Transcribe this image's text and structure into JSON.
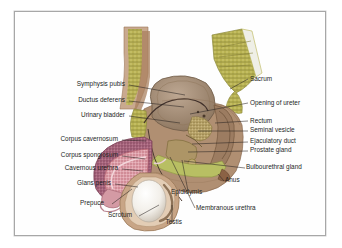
{
  "figure": {
    "frame_border_color": "#a7a7a7",
    "background_color": "#ffffff",
    "label_text_color": "#231f1d",
    "leader_line_color": "#2b2523"
  },
  "labels_left": [
    {
      "name": "symphysis-pubis",
      "text": "Symphysis pubis",
      "x": 126,
      "y": 74,
      "tx": 183,
      "ty": 84
    },
    {
      "name": "ductus-deferens",
      "text": "Ductus deferens",
      "x": 126,
      "y": 90,
      "tx": 182,
      "ty": 96
    },
    {
      "name": "urinary-bladder",
      "text": "Urinary bladder",
      "x": 126,
      "y": 105,
      "tx": 178,
      "ty": 112
    },
    {
      "name": "corpus-cavernosum",
      "text": "Corpus cavernosum",
      "x": 119,
      "y": 129,
      "tx": 144,
      "ty": 130
    },
    {
      "name": "corpus-spongiosum",
      "text": "Corpus spongiosum",
      "x": 119,
      "y": 145,
      "tx": 143,
      "ty": 148
    },
    {
      "name": "cavernous-urethra",
      "text": "Cavernous urethra",
      "x": 119,
      "y": 158,
      "tx": 141,
      "ty": 160
    },
    {
      "name": "glans-penis",
      "text": "Glans penis",
      "x": 112,
      "y": 173,
      "tx": 136,
      "ty": 176
    },
    {
      "name": "prepuce",
      "text": "Prepuce",
      "x": 104,
      "y": 195,
      "tx": 130,
      "ty": 178
    },
    {
      "name": "scrotum",
      "text": "Scrotum",
      "x": 134,
      "y": 207,
      "tx": 157,
      "ty": 196
    },
    {
      "name": "testis",
      "text": "Testis",
      "x": 168,
      "y": 215,
      "tx": 170,
      "ty": 196
    }
  ],
  "labels_right": [
    {
      "name": "sacrum",
      "text": "Sacrum",
      "x": 247,
      "y": 68,
      "tx": 228,
      "ty": 78
    },
    {
      "name": "opening-of-ureter",
      "text": "Opening of ureter",
      "x": 247,
      "y": 92,
      "tx": 188,
      "ty": 103
    },
    {
      "name": "rectum",
      "text": "Rectum",
      "x": 247,
      "y": 110,
      "tx": 213,
      "ty": 112
    },
    {
      "name": "seminal-vesicle",
      "text": "Seminal vesicle",
      "x": 247,
      "y": 120,
      "tx": 196,
      "ty": 120
    },
    {
      "name": "ejaculatory-duct",
      "text": "Ejaculatory duct",
      "x": 247,
      "y": 131,
      "tx": 190,
      "ty": 133
    },
    {
      "name": "prostate-gland",
      "text": "Prostate gland",
      "x": 247,
      "y": 140,
      "tx": 186,
      "ty": 141
    },
    {
      "name": "bulbourethral-gland",
      "text": "Bulbourethral gland",
      "x": 243,
      "y": 157,
      "tx": 182,
      "ty": 150
    },
    {
      "name": "anus",
      "text": "Anus",
      "x": 222,
      "y": 170,
      "tx": 216,
      "ty": 163
    },
    {
      "name": "epididymis",
      "text": "Epididymis",
      "x": 168,
      "y": 183,
      "tx": 180,
      "ty": 149
    },
    {
      "name": "membranous-urethra",
      "text": "Membranous urethra",
      "x": 193,
      "y": 199,
      "tx": 168,
      "ty": 146
    }
  ],
  "anatomy": {
    "sacrum_color": "#b3ad4e",
    "bladder_color": "#a08a74",
    "rectum_color": "#9a7c62",
    "corpus_cavernosum_color": "#a8637c",
    "corpus_spongiosum_color": "#e0a7b0",
    "testis_color": "#f4f2ef",
    "prostate_color": "#b7a268",
    "skin_color": "#c9a98f",
    "muscle_color": "#9c7457"
  }
}
